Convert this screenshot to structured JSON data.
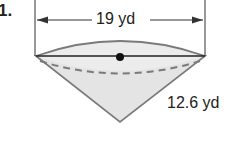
{
  "problem": {
    "number": "1."
  },
  "figure": {
    "shape": "cone",
    "diameter_label": "19 yd",
    "slant_label": "12.6 yd",
    "colors": {
      "fill": "#e6e6e6",
      "stroke": "#777777",
      "line": "#222222"
    }
  }
}
